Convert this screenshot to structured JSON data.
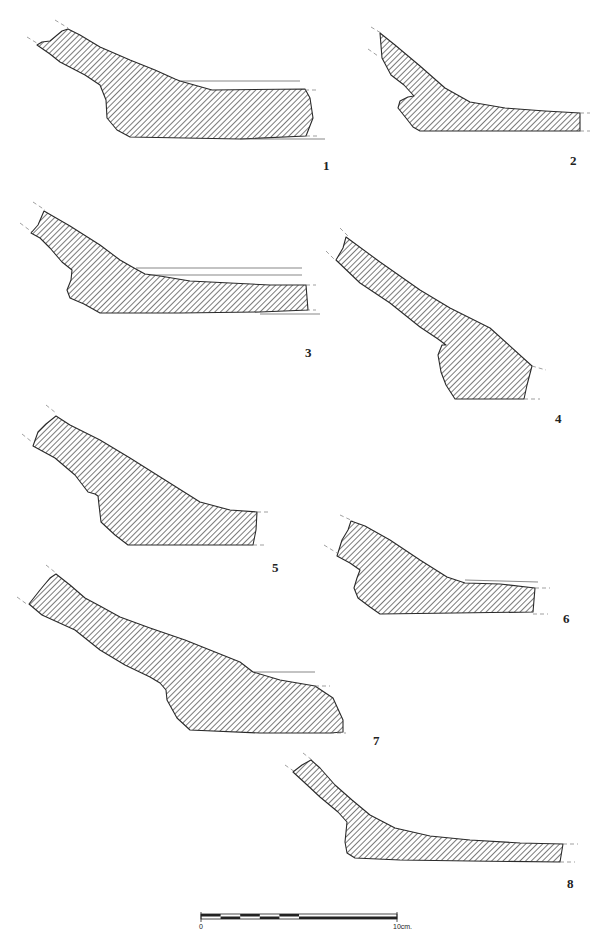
{
  "figure": {
    "type": "archaeological pottery profile drawings",
    "fill_pattern": "diagonal hatching",
    "ink_color": "#2a2a2a",
    "profiles": [
      {
        "number": "1"
      },
      {
        "number": "2"
      },
      {
        "number": "3"
      },
      {
        "number": "4"
      },
      {
        "number": "5"
      },
      {
        "number": "6"
      },
      {
        "number": "7"
      },
      {
        "number": "8"
      }
    ],
    "scale_bar": {
      "start_label": "0",
      "end_label": "10cm.",
      "segments": 10
    }
  }
}
